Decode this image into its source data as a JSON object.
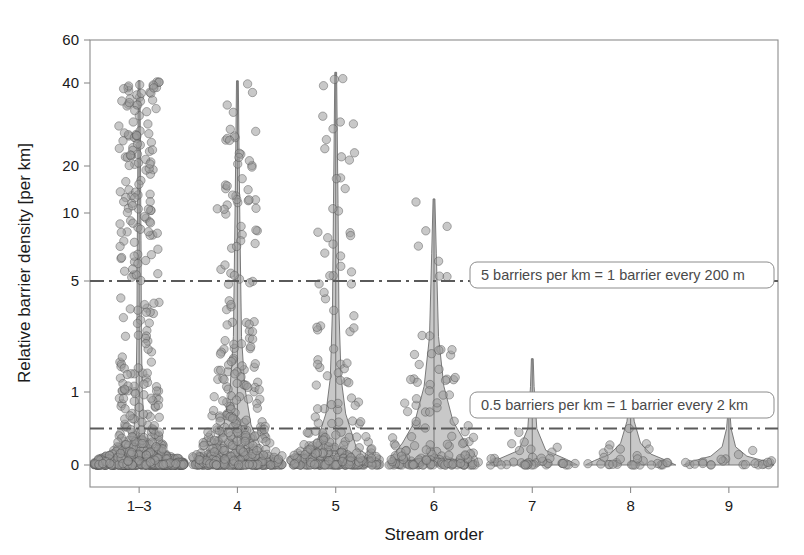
{
  "chart_data": {
    "type": "violin",
    "title": "",
    "xlabel": "Stream order",
    "ylabel": "Relative barrier density [per km]",
    "categories": [
      "1–3",
      "4",
      "5",
      "6",
      "7",
      "8",
      "9"
    ],
    "y_ticks": [
      0,
      1,
      5,
      10,
      20,
      40,
      60
    ],
    "y_tick_labels": [
      "0",
      "1",
      "5",
      "10",
      "20",
      "40",
      "60"
    ],
    "ylim": [
      0,
      60
    ],
    "y_scale": "pseudo-log (modulus/square-root-like, 0 included)",
    "grid": false,
    "legend": "none",
    "point_style": {
      "marker": "circle",
      "fill": "#9a9a9a",
      "stroke": "#4d4d4d",
      "opacity": 0.55,
      "radius_px": 4.2
    },
    "violin_style": {
      "fill": "#b5b5b5",
      "stroke": "#6e6e6e",
      "opacity": 0.75
    },
    "reference_lines": [
      {
        "name": "five-per-km-line",
        "value": 5,
        "style": "dash-dot",
        "color": "#5a5a5a",
        "label": "5 barriers per km = 1 barrier every 200 m"
      },
      {
        "name": "half-per-km-line",
        "value": 0.5,
        "style": "dash-dot",
        "color": "#5a5a5a",
        "label": "0.5 barriers per km = 1 barrier every 2 km"
      }
    ],
    "series": [
      {
        "name": "1–3",
        "n_points": 900,
        "median": 1.6,
        "max": 41,
        "violin_profile": [
          {
            "v": 0.0,
            "w": 1.0
          },
          {
            "v": 0.15,
            "w": 0.3
          },
          {
            "v": 0.4,
            "w": 0.12
          },
          {
            "v": 1.0,
            "w": 0.07
          },
          {
            "v": 3.0,
            "w": 0.05
          },
          {
            "v": 8.0,
            "w": 0.04
          },
          {
            "v": 20.0,
            "w": 0.03
          },
          {
            "v": 41.0,
            "w": 0.02
          }
        ],
        "spike_top": 41,
        "cloud_top": 41,
        "cloud_density": "very-high"
      },
      {
        "name": "4",
        "n_points": 520,
        "median": 1.3,
        "max": 41,
        "violin_profile": [
          {
            "v": 0.0,
            "w": 1.0
          },
          {
            "v": 0.2,
            "w": 0.55
          },
          {
            "v": 0.55,
            "w": 0.3
          },
          {
            "v": 1.2,
            "w": 0.16
          },
          {
            "v": 3.0,
            "w": 0.09
          },
          {
            "v": 8.0,
            "w": 0.06
          },
          {
            "v": 20.0,
            "w": 0.04
          },
          {
            "v": 41.0,
            "w": 0.02
          }
        ],
        "spike_top": 41,
        "cloud_top": 41,
        "cloud_density": "high"
      },
      {
        "name": "5",
        "n_points": 300,
        "median": 1.0,
        "max": 45,
        "violin_profile": [
          {
            "v": 0.0,
            "w": 1.0
          },
          {
            "v": 0.25,
            "w": 0.45
          },
          {
            "v": 0.7,
            "w": 0.22
          },
          {
            "v": 1.5,
            "w": 0.12
          },
          {
            "v": 4.0,
            "w": 0.07
          },
          {
            "v": 12.0,
            "w": 0.05
          },
          {
            "v": 45.0,
            "w": 0.02
          }
        ],
        "spike_top": 45,
        "cloud_top": 45,
        "cloud_density": "medium-high"
      },
      {
        "name": "6",
        "n_points": 150,
        "median": 0.35,
        "max": 13,
        "violin_profile": [
          {
            "v": 0.0,
            "w": 1.0
          },
          {
            "v": 0.1,
            "w": 0.95
          },
          {
            "v": 0.3,
            "w": 0.7
          },
          {
            "v": 0.6,
            "w": 0.42
          },
          {
            "v": 1.2,
            "w": 0.22
          },
          {
            "v": 3.0,
            "w": 0.1
          },
          {
            "v": 7.0,
            "w": 0.05
          },
          {
            "v": 13.0,
            "w": 0.02
          }
        ],
        "spike_top": 13,
        "cloud_top": 13,
        "cloud_density": "medium"
      },
      {
        "name": "7",
        "n_points": 40,
        "median": 0.08,
        "max": 2.2,
        "violin_profile": [
          {
            "v": 0.0,
            "w": 1.0
          },
          {
            "v": 0.08,
            "w": 0.75
          },
          {
            "v": 0.2,
            "w": 0.3
          },
          {
            "v": 0.5,
            "w": 0.1
          },
          {
            "v": 1.2,
            "w": 0.04
          },
          {
            "v": 2.2,
            "w": 0.02
          }
        ],
        "spike_top": 2.2,
        "cloud_top": 1.6,
        "cloud_density": "low"
      },
      {
        "name": "8",
        "n_points": 30,
        "median": 0.07,
        "max": 0.9,
        "violin_profile": [
          {
            "v": 0.0,
            "w": 1.0
          },
          {
            "v": 0.06,
            "w": 0.8
          },
          {
            "v": 0.15,
            "w": 0.45
          },
          {
            "v": 0.3,
            "w": 0.22
          },
          {
            "v": 0.6,
            "w": 0.08
          },
          {
            "v": 0.9,
            "w": 0.03
          }
        ],
        "spike_top": 0.9,
        "cloud_top": 0.8,
        "cloud_density": "low"
      },
      {
        "name": "9",
        "n_points": 22,
        "median": 0.05,
        "max": 0.75,
        "violin_profile": [
          {
            "v": 0.0,
            "w": 1.0
          },
          {
            "v": 0.05,
            "w": 0.82
          },
          {
            "v": 0.12,
            "w": 0.4
          },
          {
            "v": 0.25,
            "w": 0.15
          },
          {
            "v": 0.5,
            "w": 0.05
          },
          {
            "v": 0.75,
            "w": 0.02
          }
        ],
        "spike_top": 0.75,
        "cloud_top": 0.55,
        "cloud_density": "low"
      }
    ]
  },
  "axes": {
    "y_title": "Relative barrier density [per km]",
    "x_title": "Stream order",
    "frame_color": "#8c8c8c"
  },
  "annotations": {
    "upper": "5 barriers per km = 1 barrier every 200 m",
    "lower": "0.5 barriers per km = 1 barrier every 2 km"
  }
}
